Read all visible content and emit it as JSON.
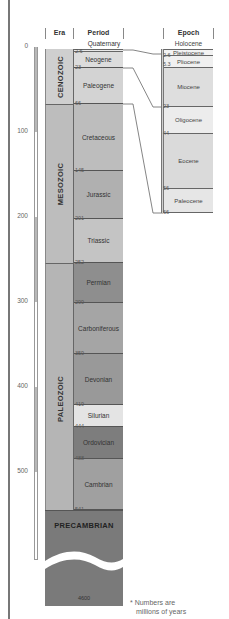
{
  "headers": {
    "era": "Era",
    "period": "Period",
    "epoch": "Epoch"
  },
  "scale": {
    "labels": [
      "0",
      "100",
      "200",
      "300",
      "400",
      "500"
    ],
    "positions": [
      46,
      131,
      216,
      301,
      386,
      471
    ]
  },
  "eras": [
    {
      "name": "CENOZOIC",
      "top": 49,
      "bottom": 104,
      "color": "#cfcfcf"
    },
    {
      "name": "MESOZOIC",
      "top": 104,
      "bottom": 263,
      "color": "#bdbdbd"
    },
    {
      "name": "PALEOZOIC",
      "top": 263,
      "bottom": 510,
      "color": "#b5b5b5"
    },
    {
      "name": "PRECAMBRIAN",
      "top": 510,
      "bottom": 605,
      "color": "#7a7a7a"
    }
  ],
  "quaternary_label": "Quaternary",
  "periods": [
    {
      "name": "Neogene",
      "top": 52,
      "bottom": 68,
      "color": "#dcdcdc",
      "start": "2.6"
    },
    {
      "name": "Paleogene",
      "top": 68,
      "bottom": 104,
      "color": "#d3d3d3",
      "start": "23"
    },
    {
      "name": "Cretaceous",
      "top": 104,
      "bottom": 171,
      "color": "#bdbdbd",
      "start": "66"
    },
    {
      "name": "Jurassic",
      "top": 171,
      "bottom": 219,
      "color": "#b0b0b0",
      "start": "145"
    },
    {
      "name": "Triassic",
      "top": 219,
      "bottom": 263,
      "color": "#c4c4c4",
      "start": "201"
    },
    {
      "name": "Permian",
      "top": 263,
      "bottom": 303,
      "color": "#8e8e8e",
      "start": "252"
    },
    {
      "name": "Carboniferous",
      "top": 303,
      "bottom": 354,
      "color": "#a5a5a5",
      "start": "299"
    },
    {
      "name": "Devonian",
      "top": 354,
      "bottom": 405,
      "color": "#999999",
      "start": "359"
    },
    {
      "name": "Silurian",
      "top": 405,
      "bottom": 427,
      "color": "#e4e4e4",
      "start": "419"
    },
    {
      "name": "Ordovician",
      "top": 427,
      "bottom": 459,
      "color": "#7d7d7d",
      "start": "444"
    },
    {
      "name": "Cambrian",
      "top": 459,
      "bottom": 510,
      "color": "#a0a0a0",
      "start": "488"
    }
  ],
  "cambrian_end": "541",
  "precambrian_start": "4600",
  "holocene_label": "Holocene",
  "epochs": [
    {
      "name": "Pleistocene",
      "top": 49,
      "bottom": 56,
      "color": "#f3f3f3",
      "start": "2.6"
    },
    {
      "name": "Pliocene",
      "top": 56,
      "bottom": 68,
      "color": "#f0f0f0",
      "start": "5.3"
    },
    {
      "name": "Miocene",
      "top": 68,
      "bottom": 107,
      "color": "#dedede",
      "start": "23"
    },
    {
      "name": "Oligocene",
      "top": 107,
      "bottom": 134,
      "color": "#ececec",
      "start": "23"
    },
    {
      "name": "Eocene",
      "top": 134,
      "bottom": 189,
      "color": "#dadada",
      "start": "44"
    },
    {
      "name": "Paleocene",
      "top": 189,
      "bottom": 213,
      "color": "#e6e6e6",
      "start": "56"
    }
  ],
  "epoch_end": "66",
  "note": {
    "line1": "* Numbers are",
    "line2": "millions of years"
  }
}
